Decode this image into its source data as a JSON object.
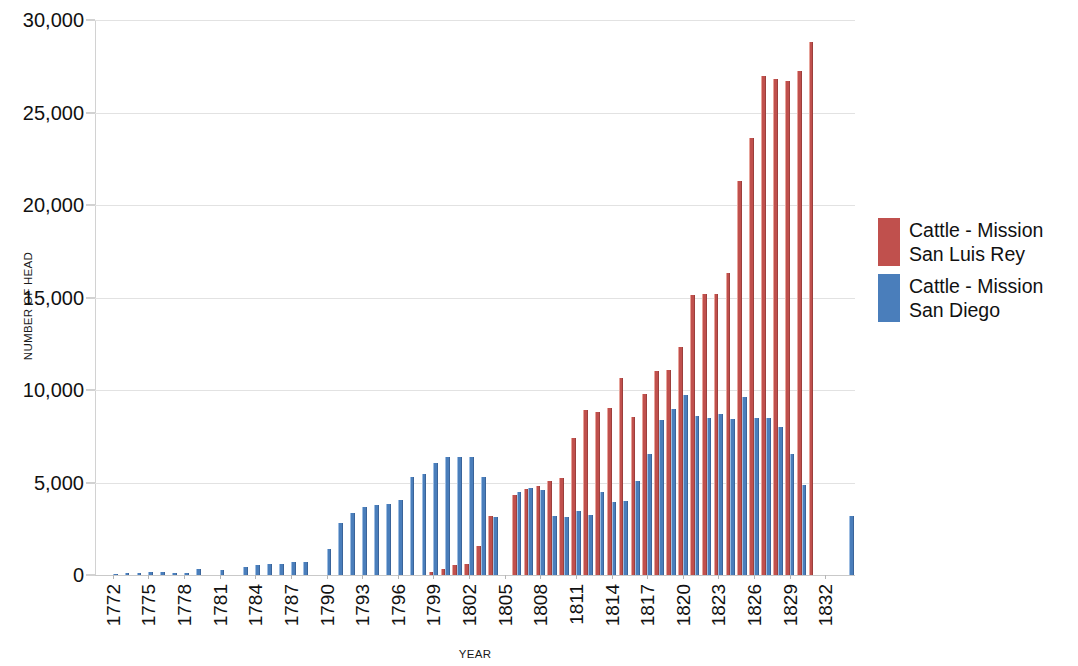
{
  "chart_data": {
    "type": "bar",
    "title": "",
    "xlabel": "YEAR",
    "ylabel": "NUMBER OF HEAD",
    "ylim": [
      0,
      30000
    ],
    "ytick_labels": [
      "0",
      "5,000",
      "10,000",
      "15,000",
      "20,000",
      "25,000",
      "30,000"
    ],
    "ytick_values": [
      0,
      5000,
      10000,
      15000,
      20000,
      25000,
      30000
    ],
    "xtick_labels": [
      "1772",
      "1775",
      "1778",
      "1781",
      "1784",
      "1787",
      "1790",
      "1793",
      "1796",
      "1799",
      "1802",
      "1805",
      "1808",
      "1811",
      "1814",
      "1817",
      "1820",
      "1823",
      "1826",
      "1829",
      "1832"
    ],
    "xtick_values": [
      1772,
      1775,
      1778,
      1781,
      1784,
      1787,
      1790,
      1793,
      1796,
      1799,
      1802,
      1805,
      1808,
      1811,
      1814,
      1817,
      1820,
      1823,
      1826,
      1829,
      1832
    ],
    "grid": true,
    "legend_position": "right",
    "x_domain": [
      1771,
      1835
    ],
    "categories": [
      1772,
      1773,
      1774,
      1775,
      1776,
      1777,
      1778,
      1779,
      1780,
      1781,
      1782,
      1783,
      1784,
      1785,
      1786,
      1787,
      1788,
      1789,
      1790,
      1791,
      1792,
      1793,
      1794,
      1795,
      1796,
      1797,
      1798,
      1799,
      1800,
      1801,
      1802,
      1803,
      1804,
      1805,
      1806,
      1807,
      1808,
      1809,
      1810,
      1811,
      1812,
      1813,
      1814,
      1815,
      1816,
      1817,
      1818,
      1819,
      1820,
      1821,
      1822,
      1823,
      1824,
      1825,
      1826,
      1827,
      1828,
      1829,
      1830,
      1831,
      1832,
      1833,
      1834
    ],
    "series": [
      {
        "name": "Cattle - Mission San Luis Rey",
        "color": "#c0504d",
        "values": [
          null,
          null,
          null,
          null,
          null,
          null,
          null,
          null,
          null,
          null,
          null,
          null,
          null,
          null,
          null,
          null,
          null,
          null,
          null,
          null,
          null,
          null,
          null,
          null,
          null,
          null,
          null,
          162,
          300,
          530,
          600,
          1580,
          3180,
          null,
          4350,
          4650,
          4800,
          5100,
          5250,
          7400,
          8900,
          8800,
          9050,
          10650,
          8550,
          9800,
          11050,
          11100,
          12350,
          15150,
          15200,
          15200,
          16300,
          21300,
          23600,
          26950,
          26800,
          26700,
          27250,
          28800,
          null,
          null,
          null
        ]
      },
      {
        "name": "Cattle - Mission San Diego",
        "color": "#4a7ebb",
        "values": [
          65,
          100,
          120,
          180,
          160,
          120,
          130,
          330,
          null,
          250,
          null,
          420,
          530,
          570,
          600,
          680,
          700,
          null,
          1420,
          2820,
          3340,
          3650,
          3780,
          3830,
          4050,
          5320,
          5480,
          6050,
          6400,
          6380,
          6400,
          5300,
          3150,
          null,
          4500,
          4700,
          4620,
          3200,
          3150,
          3480,
          3260,
          4500,
          3950,
          4000,
          5100,
          6550,
          8400,
          8950,
          9750,
          8600,
          8500,
          8700,
          8450,
          9600,
          8500,
          8500,
          8000,
          6550,
          4850,
          null,
          null,
          null,
          3200
        ]
      }
    ]
  },
  "legend": {
    "entries": [
      {
        "label": "Cattle - Mission\nSan Luis Rey",
        "color": "#c0504d"
      },
      {
        "label": "Cattle - Mission\nSan Diego",
        "color": "#4a7ebb"
      }
    ]
  }
}
